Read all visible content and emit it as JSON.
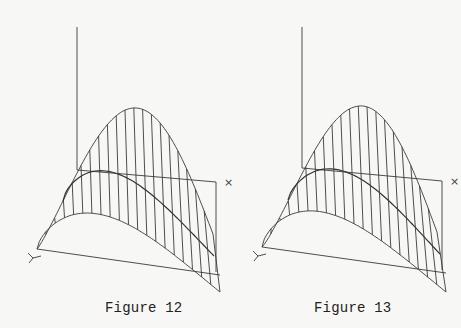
{
  "figures": [
    {
      "id": "fig12",
      "caption": "Figure 12",
      "caption_pos": {
        "x": 105,
        "y": 300
      },
      "offset_x": 0,
      "axis_labels": {
        "x": "×",
        "y": "Y"
      },
      "z_axis": {
        "x": 77,
        "y1": 27,
        "y2": 170
      },
      "back_right": {
        "x": 216,
        "y": 182,
        "y_bottom": 272
      },
      "front_left": {
        "x": 37,
        "y": 249
      },
      "bottom_right": {
        "x": 220,
        "y": 292
      },
      "right_end": {
        "x": 213,
        "y": 234
      },
      "peak": {
        "x": 133,
        "y": 108
      },
      "mid_start": {
        "x": 63,
        "y": 201
      },
      "mid_peak": {
        "x": 118,
        "y": 174
      },
      "mid_end": {
        "x": 214,
        "y": 256
      },
      "low_peak": {
        "x": 103,
        "y": 215
      },
      "rulings": 20
    },
    {
      "id": "fig13",
      "caption": "Figure 13",
      "caption_pos": {
        "x": 314,
        "y": 300
      },
      "offset_x": 0,
      "axis_labels": {
        "x": "×",
        "y": "Y"
      },
      "z_axis": {
        "x": 302,
        "y1": 27,
        "y2": 168
      },
      "back_right": {
        "x": 442,
        "y": 181,
        "y_bottom": 270
      },
      "front_left": {
        "x": 262,
        "y": 247
      },
      "bottom_right": {
        "x": 446,
        "y": 292
      },
      "right_end": {
        "x": 437,
        "y": 232
      },
      "peak": {
        "x": 359,
        "y": 106
      },
      "mid_start": {
        "x": 288,
        "y": 200
      },
      "mid_peak": {
        "x": 346,
        "y": 172
      },
      "mid_end": {
        "x": 440,
        "y": 254
      },
      "low_peak": {
        "x": 327,
        "y": 213
      },
      "rulings": 20
    }
  ]
}
